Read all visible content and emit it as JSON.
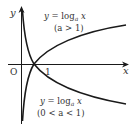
{
  "diagram": {
    "type": "function-graph",
    "axes": {
      "x_label": "x",
      "y_label": "y",
      "origin_label": "O",
      "tick_label": "1"
    },
    "curves": [
      {
        "name": "increasing",
        "label_eq_prefix": "y = log",
        "label_eq_sub": "a",
        "label_eq_suffix": " x",
        "label_cond": "(a > 1)"
      },
      {
        "name": "decreasing",
        "label_eq_prefix": "y = log",
        "label_eq_sub": "a",
        "label_eq_suffix": " x",
        "label_cond": "(0 < a < 1)"
      }
    ],
    "colors": {
      "stroke": "#1a1a1a",
      "text": "#333333"
    }
  }
}
